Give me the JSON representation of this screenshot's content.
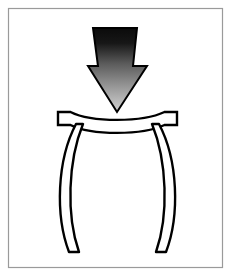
{
  "figure": {
    "type": "engineering-schematic",
    "width": 233,
    "height": 277,
    "background_color": "#ffffff"
  },
  "frame": {
    "name": "figure-border",
    "stroke_color": "#9a9a9a",
    "stroke_width": 1.2,
    "fill_color": "#ffffff",
    "x": 8,
    "y": 8,
    "width": 215,
    "height": 260
  },
  "arrow": {
    "name": "load-arrow",
    "direction": "down",
    "outline_color": "#000000",
    "outline_width": 2,
    "gradient_top_color": "#0b0b0b",
    "gradient_bottom_color": "#cfcfcf",
    "shaft_top_left_x": 93,
    "shaft_top_right_x": 137,
    "shaft_top_y": 28,
    "shaft_bottom_left_x": 98,
    "shaft_bottom_right_x": 133,
    "shoulder_y": 66,
    "head_left_x": 88,
    "head_right_x": 147,
    "tip_x": 117,
    "tip_y": 112
  },
  "beam": {
    "name": "loaded-beam-plate",
    "description": "Horizontal plate sagging downward at midspan",
    "outline_color": "#000000",
    "outline_width": 2.4,
    "fill_color": "#ffffff",
    "left_x": 58,
    "right_x": 177,
    "top_y": 112,
    "end_block_height": 13,
    "midspan_sag": 9,
    "thickness": 8
  },
  "legs": [
    {
      "name": "left-column-leg",
      "side": "left",
      "bow_direction": "outward-left",
      "outline_color": "#000000",
      "outline_width": 2.4,
      "fill_color": "#ffffff",
      "top_x": 72,
      "top_y": 125,
      "bottom_x": 72,
      "bottom_y": 254,
      "bow_extent": 16,
      "width_top": 7,
      "width_bottom": 10
    },
    {
      "name": "right-column-leg",
      "side": "right",
      "bow_direction": "outward-right",
      "outline_color": "#000000",
      "outline_width": 2.4,
      "fill_color": "#ffffff",
      "top_x": 163,
      "top_y": 125,
      "bottom_x": 163,
      "bottom_y": 254,
      "bow_extent": 16,
      "width_top": 7,
      "width_bottom": 10
    }
  ],
  "labels": {
    "arrow_label": "",
    "beam_label": "",
    "leg_label": "",
    "caption": ""
  }
}
